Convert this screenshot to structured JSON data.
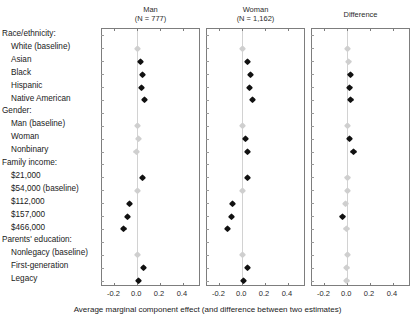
{
  "chart_data": {
    "type": "scatter",
    "title": "",
    "xlabel": "Average marginal component effect (and difference between two estimates)",
    "ylabel": "",
    "xlim": [
      -0.3,
      0.55
    ],
    "xticks": [
      -0.2,
      0.0,
      0.2,
      0.4
    ],
    "xticklabels": [
      "-0.2",
      "0.0",
      "0.2",
      "0.4"
    ],
    "grid": false,
    "legend": "none",
    "orientation": "horizontal-forest-plot",
    "panels": [
      {
        "label": "Man",
        "sublabel": "(N = 777)",
        "n": 777
      },
      {
        "label": "Woman",
        "sublabel": "(N = 1,162)",
        "n": 1162
      },
      {
        "label": "Difference",
        "sublabel": "",
        "n": null
      }
    ],
    "groups": [
      {
        "name": "Race/ethnicity:",
        "rows": [
          {
            "label": "White (baseline)",
            "baseline": true
          },
          {
            "label": "Asian",
            "baseline": false
          },
          {
            "label": "Black",
            "baseline": false
          },
          {
            "label": "Hispanic",
            "baseline": false
          },
          {
            "label": "Native American",
            "baseline": false
          }
        ]
      },
      {
        "name": "Gender:",
        "rows": [
          {
            "label": "Man (baseline)",
            "baseline": true
          },
          {
            "label": "Woman",
            "baseline": false
          },
          {
            "label": "Nonbinary",
            "baseline": false
          }
        ]
      },
      {
        "name": "Family income:",
        "rows": [
          {
            "label": "$21,000",
            "baseline": false
          },
          {
            "label": "$54,000 (baseline)",
            "baseline": true
          },
          {
            "label": "$112,000",
            "baseline": false
          },
          {
            "label": "$157,000",
            "baseline": false
          },
          {
            "label": "$466,000",
            "baseline": false
          }
        ]
      },
      {
        "name": "Parents' education:",
        "rows": [
          {
            "label": "Nonlegacy (baseline)",
            "baseline": true
          },
          {
            "label": "First-generation",
            "baseline": false
          },
          {
            "label": "Legacy",
            "baseline": false
          }
        ]
      }
    ],
    "series": [
      {
        "name": "Man",
        "panel": 0,
        "values": [
          {
            "row": "White (baseline)",
            "estimate": 0.0,
            "ci_low": 0.0,
            "ci_high": 0.0,
            "style": "light"
          },
          {
            "row": "Asian",
            "estimate": 0.03,
            "ci_low": 0.013,
            "ci_high": 0.047,
            "style": "dark"
          },
          {
            "row": "Black",
            "estimate": 0.047,
            "ci_low": 0.03,
            "ci_high": 0.064,
            "style": "dark"
          },
          {
            "row": "Hispanic",
            "estimate": 0.04,
            "ci_low": 0.023,
            "ci_high": 0.057,
            "style": "dark"
          },
          {
            "row": "Native American",
            "estimate": 0.062,
            "ci_low": 0.045,
            "ci_high": 0.079,
            "style": "dark"
          },
          {
            "row": "Man (baseline)",
            "estimate": 0.0,
            "ci_low": 0.0,
            "ci_high": 0.0,
            "style": "light"
          },
          {
            "row": "Woman",
            "estimate": 0.007,
            "ci_low": -0.008,
            "ci_high": 0.022,
            "style": "light"
          },
          {
            "row": "Nonbinary",
            "estimate": -0.008,
            "ci_low": -0.03,
            "ci_high": 0.014,
            "style": "light"
          },
          {
            "row": "$21,000",
            "estimate": 0.043,
            "ci_low": 0.025,
            "ci_high": 0.061,
            "style": "dark"
          },
          {
            "row": "$54,000 (baseline)",
            "estimate": 0.0,
            "ci_low": 0.0,
            "ci_high": 0.0,
            "style": "light"
          },
          {
            "row": "$112,000",
            "estimate": -0.068,
            "ci_low": -0.087,
            "ci_high": -0.049,
            "style": "dark"
          },
          {
            "row": "$157,000",
            "estimate": -0.088,
            "ci_low": -0.107,
            "ci_high": -0.069,
            "style": "dark"
          },
          {
            "row": "$466,000",
            "estimate": -0.118,
            "ci_low": -0.139,
            "ci_high": -0.097,
            "style": "dark"
          },
          {
            "row": "Nonlegacy (baseline)",
            "estimate": 0.0,
            "ci_low": 0.0,
            "ci_high": 0.0,
            "style": "light"
          },
          {
            "row": "First-generation",
            "estimate": 0.055,
            "ci_low": 0.038,
            "ci_high": 0.072,
            "style": "dark"
          },
          {
            "row": "Legacy",
            "estimate": 0.012,
            "ci_low": -0.005,
            "ci_high": 0.029,
            "style": "dark"
          }
        ]
      },
      {
        "name": "Woman",
        "panel": 1,
        "values": [
          {
            "row": "White (baseline)",
            "estimate": 0.0,
            "ci_low": 0.0,
            "ci_high": 0.0,
            "style": "light"
          },
          {
            "row": "Asian",
            "estimate": 0.043,
            "ci_low": 0.03,
            "ci_high": 0.056,
            "style": "dark"
          },
          {
            "row": "Black",
            "estimate": 0.072,
            "ci_low": 0.059,
            "ci_high": 0.085,
            "style": "dark"
          },
          {
            "row": "Hispanic",
            "estimate": 0.064,
            "ci_low": 0.051,
            "ci_high": 0.077,
            "style": "dark"
          },
          {
            "row": "Native American",
            "estimate": 0.092,
            "ci_low": 0.078,
            "ci_high": 0.106,
            "style": "dark"
          },
          {
            "row": "Man (baseline)",
            "estimate": 0.0,
            "ci_low": 0.0,
            "ci_high": 0.0,
            "style": "light"
          },
          {
            "row": "Woman",
            "estimate": 0.028,
            "ci_low": 0.016,
            "ci_high": 0.04,
            "style": "dark"
          },
          {
            "row": "Nonbinary",
            "estimate": 0.046,
            "ci_low": 0.03,
            "ci_high": 0.062,
            "style": "dark"
          },
          {
            "row": "$21,000",
            "estimate": 0.046,
            "ci_low": 0.032,
            "ci_high": 0.06,
            "style": "dark"
          },
          {
            "row": "$54,000 (baseline)",
            "estimate": 0.0,
            "ci_low": 0.0,
            "ci_high": 0.0,
            "style": "light"
          },
          {
            "row": "$112,000",
            "estimate": -0.082,
            "ci_low": -0.096,
            "ci_high": -0.068,
            "style": "dark"
          },
          {
            "row": "$157,000",
            "estimate": -0.092,
            "ci_low": -0.106,
            "ci_high": -0.078,
            "style": "dark"
          },
          {
            "row": "$466,000",
            "estimate": -0.128,
            "ci_low": -0.143,
            "ci_high": -0.113,
            "style": "dark"
          },
          {
            "row": "Nonlegacy (baseline)",
            "estimate": 0.0,
            "ci_low": 0.0,
            "ci_high": 0.0,
            "style": "light"
          },
          {
            "row": "First-generation",
            "estimate": 0.05,
            "ci_low": 0.037,
            "ci_high": 0.063,
            "style": "dark"
          },
          {
            "row": "Legacy",
            "estimate": 0.008,
            "ci_low": -0.005,
            "ci_high": 0.021,
            "style": "dark"
          }
        ]
      },
      {
        "name": "Difference",
        "panel": 2,
        "values": [
          {
            "row": "White (baseline)",
            "estimate": 0.0,
            "ci_low": 0.0,
            "ci_high": 0.0,
            "style": "light"
          },
          {
            "row": "Asian",
            "estimate": 0.013,
            "ci_low": -0.009,
            "ci_high": 0.035,
            "style": "light"
          },
          {
            "row": "Black",
            "estimate": 0.025,
            "ci_low": 0.003,
            "ci_high": 0.047,
            "style": "dark"
          },
          {
            "row": "Hispanic",
            "estimate": 0.024,
            "ci_low": 0.002,
            "ci_high": 0.046,
            "style": "dark"
          },
          {
            "row": "Native American",
            "estimate": 0.03,
            "ci_low": 0.008,
            "ci_high": 0.052,
            "style": "dark"
          },
          {
            "row": "Man (baseline)",
            "estimate": 0.0,
            "ci_low": 0.0,
            "ci_high": 0.0,
            "style": "light"
          },
          {
            "row": "Woman",
            "estimate": 0.021,
            "ci_low": 0.002,
            "ci_high": 0.04,
            "style": "dark"
          },
          {
            "row": "Nonbinary",
            "estimate": 0.054,
            "ci_low": 0.027,
            "ci_high": 0.081,
            "style": "dark"
          },
          {
            "row": "$21,000",
            "estimate": 0.003,
            "ci_low": -0.02,
            "ci_high": 0.026,
            "style": "light"
          },
          {
            "row": "$54,000 (baseline)",
            "estimate": 0.0,
            "ci_low": 0.0,
            "ci_high": 0.0,
            "style": "light"
          },
          {
            "row": "$112,000",
            "estimate": -0.014,
            "ci_low": -0.037,
            "ci_high": 0.009,
            "style": "light"
          },
          {
            "row": "$157,000",
            "estimate": -0.042,
            "ci_low": -0.065,
            "ci_high": -0.019,
            "style": "dark"
          },
          {
            "row": "$466,000",
            "estimate": -0.01,
            "ci_low": -0.036,
            "ci_high": 0.016,
            "style": "light"
          },
          {
            "row": "Nonlegacy (baseline)",
            "estimate": 0.0,
            "ci_low": 0.0,
            "ci_high": 0.0,
            "style": "light"
          },
          {
            "row": "First-generation",
            "estimate": -0.005,
            "ci_low": -0.027,
            "ci_high": 0.017,
            "style": "light"
          },
          {
            "row": "Legacy",
            "estimate": -0.004,
            "ci_low": -0.026,
            "ci_high": 0.018,
            "style": "light"
          }
        ]
      }
    ]
  },
  "axis": {
    "caption": "Average marginal component effect (and difference between two estimates)"
  }
}
